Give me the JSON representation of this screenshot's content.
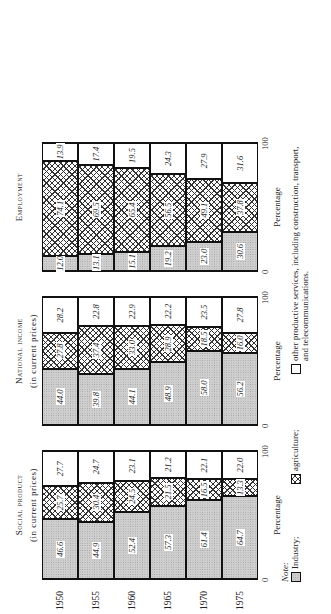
{
  "chart_data": [
    {
      "type": "bar",
      "stacked": true,
      "orientation": "horizontal",
      "title": "Social product",
      "subtitle": "(in current prices)",
      "categories": [
        "1950",
        "1955",
        "1960",
        "1965",
        "1970",
        "1975"
      ],
      "series": [
        {
          "name": "Industry",
          "values": [
            46.6,
            44.9,
            52.4,
            57.3,
            61.4,
            64.7
          ]
        },
        {
          "name": "Agriculture",
          "values": [
            25.7,
            30.4,
            24.5,
            21.5,
            16.5,
            13.3
          ]
        },
        {
          "name": "Other productive services",
          "values": [
            27.7,
            24.7,
            23.1,
            21.2,
            22.1,
            22.0
          ]
        }
      ],
      "xlabel": "Percentage",
      "xlim": [
        0,
        100
      ],
      "ticks": [
        "0",
        "100"
      ]
    },
    {
      "type": "bar",
      "stacked": true,
      "orientation": "horizontal",
      "title": "National income",
      "subtitle": "(in current prices)",
      "categories": [
        "1950",
        "1955",
        "1960",
        "1965",
        "1970",
        "1975"
      ],
      "series": [
        {
          "name": "Industry",
          "values": [
            44.0,
            39.8,
            44.1,
            48.9,
            58.0,
            56.2
          ]
        },
        {
          "name": "Agriculture",
          "values": [
            27.8,
            37.4,
            33.0,
            28.9,
            18.5,
            16.0
          ]
        },
        {
          "name": "Other productive services",
          "values": [
            28.2,
            22.8,
            22.9,
            22.2,
            23.5,
            27.8
          ]
        }
      ],
      "xlabel": "Percentage",
      "xlim": [
        0,
        100
      ],
      "ticks": [
        "0",
        "100"
      ]
    },
    {
      "type": "bar",
      "stacked": true,
      "orientation": "horizontal",
      "title": "Employment",
      "subtitle": "",
      "categories": [
        "1950",
        "1955",
        "1960",
        "1965",
        "1970",
        "1975"
      ],
      "series": [
        {
          "name": "Industry",
          "values": [
            12.0,
            13.1,
            15.1,
            19.2,
            23.0,
            30.6
          ]
        },
        {
          "name": "Agriculture",
          "values": [
            74.1,
            69.5,
            65.4,
            56.5,
            49.1,
            37.8
          ]
        },
        {
          "name": "Other productive services",
          "values": [
            13.9,
            17.4,
            19.5,
            24.3,
            27.9,
            31.6
          ]
        }
      ],
      "xlabel": "Percentage",
      "xlim": [
        0,
        100
      ],
      "ticks": [
        "0",
        "100"
      ]
    }
  ],
  "legend": {
    "note_label": "Note:",
    "items": [
      {
        "key": "ind",
        "label": "Industry;"
      },
      {
        "key": "agr",
        "label": "agriculture;"
      },
      {
        "key": "oth",
        "label": "other productive services, including construction, transport, and telecommunications."
      }
    ]
  }
}
